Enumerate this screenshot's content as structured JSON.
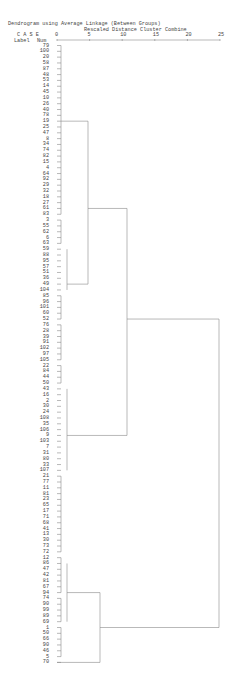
{
  "chart_data": {
    "type": "dendrogram",
    "title": "Dendrogram using Average Linkage (Between Groups)",
    "subtitle": "Rescaled Distance Cluster Combine",
    "header": {
      "case": "C A S E",
      "label": "Label",
      "num": "Num"
    },
    "xaxis": {
      "ticks": [
        0,
        5,
        10,
        15,
        20,
        25
      ],
      "label": "Rescaled Distance Cluster Combine",
      "range": [
        0,
        25
      ]
    },
    "leaves": [
      "79",
      "100",
      "20",
      "58",
      "87",
      "48",
      "53",
      "14",
      "45",
      "10",
      "26",
      "40",
      "78",
      "19",
      "25",
      "47",
      "8",
      "34",
      "74",
      "82",
      "15",
      "4",
      "64",
      "92",
      "29",
      "32",
      "18",
      "27",
      "61",
      "83",
      "3",
      "55",
      "62",
      "6",
      "63",
      "59",
      "88",
      "95",
      "57",
      "51",
      "36",
      "49",
      "104",
      "85",
      "96",
      "101",
      "60",
      "52",
      "76",
      "28",
      "39",
      "91",
      "102",
      "97",
      "105",
      "22",
      "84",
      "44",
      "50",
      "43",
      "16",
      "2",
      "30",
      "24",
      "108",
      "35",
      "106",
      "9",
      "103",
      "7",
      "31",
      "80",
      "33",
      "107",
      "21",
      "77",
      "11",
      "81",
      "23",
      "65",
      "17",
      "71",
      "68",
      "41",
      "13",
      "30",
      "73",
      "72",
      "12",
      "86",
      "47",
      "42",
      "81",
      "67",
      "94",
      "74",
      "90",
      "99",
      "89",
      "69",
      "1",
      "50",
      "66",
      "90",
      "46",
      "5",
      "70"
    ],
    "merges": [
      {
        "rows": [
          0,
          29
        ],
        "distance": 1,
        "link_row": 13
      },
      {
        "rows": [
          30,
          54
        ],
        "distance": 2,
        "link_row": 41
      },
      {
        "rows": [
          13,
          41
        ],
        "distance": 5,
        "link_row": 28
      },
      {
        "rows": [
          55,
          87
        ],
        "distance": 2,
        "link_row": 67
      },
      {
        "rows": [
          28,
          67
        ],
        "distance": 11,
        "link_row": 47
      },
      {
        "rows": [
          88,
          99
        ],
        "distance": 2,
        "link_row": 94
      },
      {
        "rows": [
          94,
          106
        ],
        "distance": 7,
        "link_row": 100
      },
      {
        "rows": [
          47,
          100
        ],
        "distance": 25,
        "link_row": 74
      }
    ]
  }
}
